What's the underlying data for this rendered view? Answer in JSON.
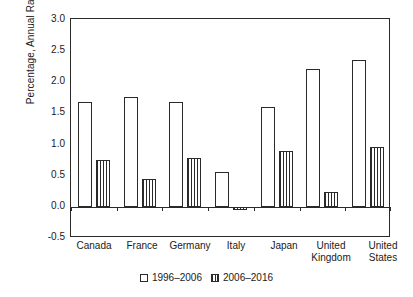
{
  "chart_data": {
    "type": "bar",
    "title": "",
    "xlabel": "",
    "ylabel": "Percentage, Annual Rate",
    "ylim": [
      -0.5,
      3.0
    ],
    "yticks": [
      "3.0",
      "2.5",
      "2.0",
      "1.5",
      "1.0",
      "0.5",
      "0.0",
      "-0.5"
    ],
    "ytick_values": [
      3.0,
      2.5,
      2.0,
      1.5,
      1.0,
      0.5,
      0.0,
      -0.5
    ],
    "grid": false,
    "legend_position": "bottom-center",
    "categories": [
      "Canada",
      "France",
      "Germany",
      "Italy",
      "Japan",
      "United\nKingdom",
      "United\nStates"
    ],
    "series": [
      {
        "name": "1996–2006",
        "pattern": "open",
        "values": [
          1.68,
          1.75,
          1.68,
          0.56,
          1.6,
          2.2,
          2.35
        ]
      },
      {
        "name": "2006–2016",
        "pattern": "vertical-hatch",
        "values": [
          0.75,
          0.45,
          0.78,
          -0.05,
          0.89,
          0.23,
          0.96
        ]
      }
    ]
  },
  "legend": {
    "items": [
      {
        "label": "1996–2006",
        "marker": "open-square-icon"
      },
      {
        "label": "2006–2016",
        "marker": "hatched-square-icon"
      }
    ]
  }
}
